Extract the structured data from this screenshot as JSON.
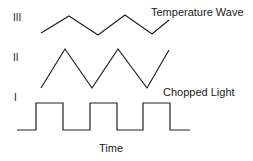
{
  "diagram": {
    "colors": {
      "line": "#222222",
      "background": "#ffffff"
    },
    "rows": [
      {
        "roman": "III",
        "label": "Temperature Wave",
        "shape": "triangle-low-amplitude",
        "points": [
          [
            41,
            33
          ],
          [
            69,
            16
          ],
          [
            98,
            35
          ],
          [
            125,
            15
          ],
          [
            152,
            34
          ],
          [
            169,
            20
          ]
        ]
      },
      {
        "roman": "II",
        "label": "",
        "shape": "triangle-high-amplitude",
        "points": [
          [
            41,
            88
          ],
          [
            65,
            49
          ],
          [
            92,
            88
          ],
          [
            118,
            49
          ],
          [
            147,
            88
          ],
          [
            169,
            50
          ]
        ]
      },
      {
        "roman": "I",
        "label": "Chopped Light",
        "shape": "square",
        "points": [
          [
            17,
            130
          ],
          [
            36,
            130
          ],
          [
            36,
            103
          ],
          [
            63,
            103
          ],
          [
            63,
            130
          ],
          [
            90,
            130
          ],
          [
            90,
            103
          ],
          [
            117,
            103
          ],
          [
            117,
            130
          ],
          [
            143,
            130
          ],
          [
            143,
            103
          ],
          [
            170,
            103
          ],
          [
            170,
            130
          ],
          [
            190,
            130
          ]
        ]
      }
    ],
    "x_axis_label": "Time"
  }
}
